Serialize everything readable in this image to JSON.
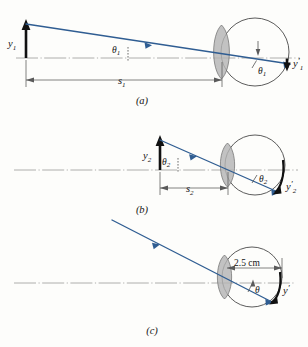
{
  "figure": {
    "type": "optics-ray-diagram",
    "colors": {
      "ray": "#2f5d92",
      "object_arrow": "#111111",
      "lens_fill": "#b4b4b4",
      "eye_outline": "#4a4a4a",
      "axis": "#9a9a9a",
      "background": "#fdfdfb"
    },
    "panels": [
      {
        "id": "a",
        "label": "(a)",
        "object_label": "y",
        "object_sub": "1",
        "angle_label": "θ",
        "angle_sub": "1",
        "angle_label_inside": "θ",
        "angle_sub_inside": "1",
        "distance_label": "s",
        "distance_sub": "1",
        "image_label": "y",
        "image_sub": "1",
        "image_prime": "′"
      },
      {
        "id": "b",
        "label": "(b)",
        "object_label": "y",
        "object_sub": "2",
        "angle_label": "θ",
        "angle_sub": "2",
        "angle_label_inside": "θ",
        "angle_sub_inside": "2",
        "distance_label": "s",
        "distance_sub": "2",
        "image_label": "y",
        "image_sub": "2",
        "image_prime": "′"
      },
      {
        "id": "c",
        "label": "(c)",
        "angle_label": "θ",
        "angle_sub": "",
        "eye_diameter_label": "2.5 cm",
        "image_label": "y",
        "image_sub": "",
        "image_prime": "′"
      }
    ]
  }
}
